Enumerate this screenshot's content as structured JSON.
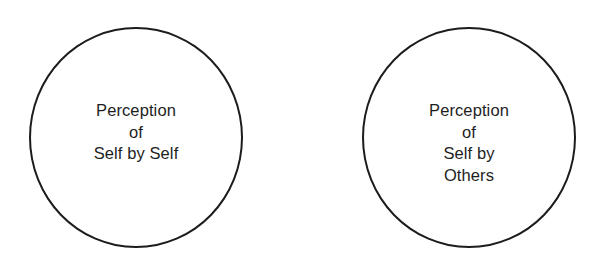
{
  "diagram": {
    "type": "two-circle concept diagram",
    "circles": [
      {
        "id": "self-by-self",
        "lines": [
          "Perception",
          "of",
          "Self by Self"
        ]
      },
      {
        "id": "self-by-others",
        "lines": [
          "Perception",
          "of",
          "Self by",
          "Others"
        ]
      }
    ],
    "colors": {
      "background": "#ffffff",
      "stroke": "#1c1c1c",
      "text": "#1e1e1e"
    }
  }
}
